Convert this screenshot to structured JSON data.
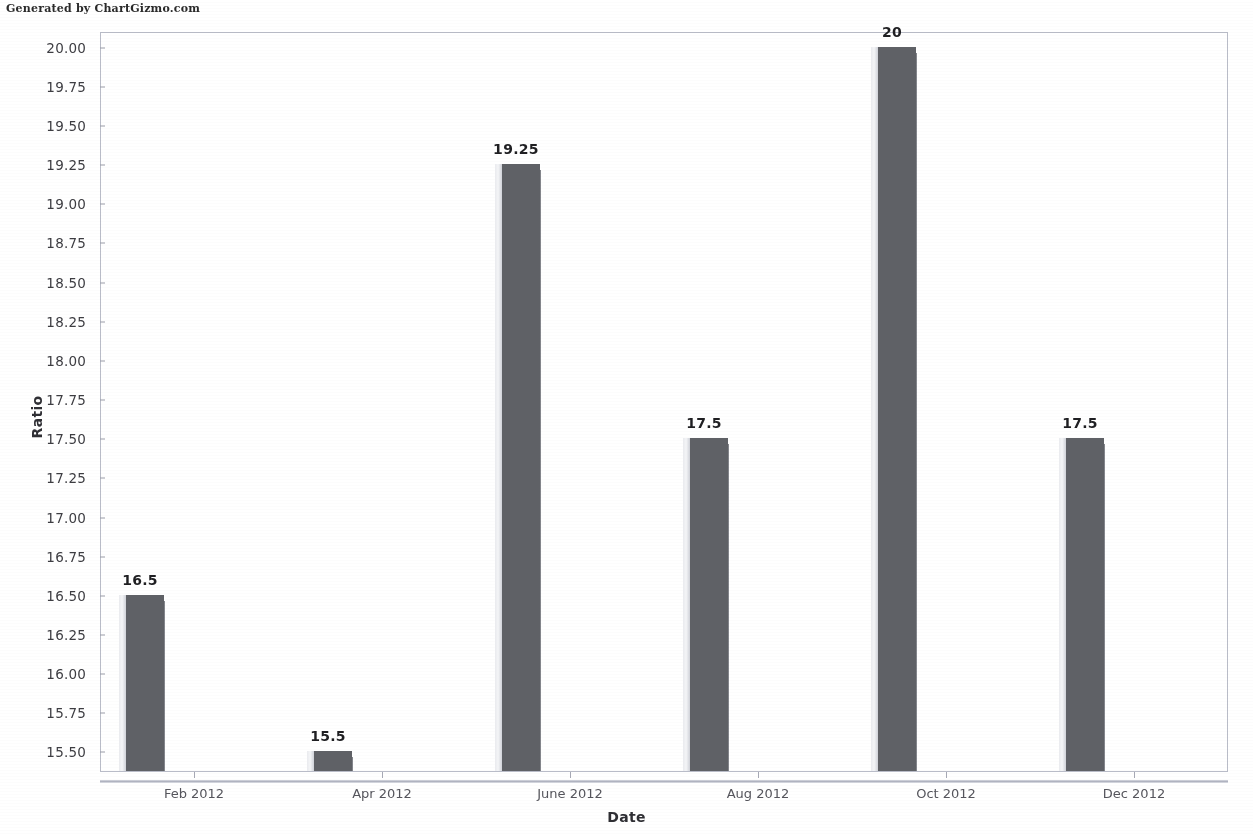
{
  "watermark": "Generated by ChartGizmo.com",
  "chart_data": {
    "type": "bar",
    "title": "",
    "xlabel": "Date",
    "ylabel": "Ratio",
    "categories": [
      "Feb 2012",
      "Apr 2012",
      "June 2012",
      "Aug 2012",
      "Oct 2012",
      "Dec 2012"
    ],
    "values": [
      16.5,
      15.5,
      19.25,
      17.5,
      20,
      17.5
    ],
    "value_labels": [
      "16.5",
      "15.5",
      "19.25",
      "17.5",
      "20",
      "17.5"
    ],
    "ylim": [
      15.375,
      20.1
    ],
    "ytick_values": [
      20.0,
      19.75,
      19.5,
      19.25,
      19.0,
      18.75,
      18.5,
      18.25,
      18.0,
      17.75,
      17.5,
      17.25,
      17.0,
      16.75,
      16.5,
      16.25,
      16.0,
      15.75,
      15.5
    ],
    "ytick_labels": [
      "20.00",
      "19.75",
      "19.50",
      "19.25",
      "19.00",
      "18.75",
      "18.50",
      "18.25",
      "18.00",
      "17.75",
      "17.50",
      "17.25",
      "17.00",
      "16.75",
      "16.50",
      "16.25",
      "16.00",
      "15.75",
      "15.50"
    ],
    "grid": false,
    "legend": false,
    "bar_color": "#5f6166",
    "frame_color": "#b9bcc8",
    "label_color": "#3d3d42"
  }
}
